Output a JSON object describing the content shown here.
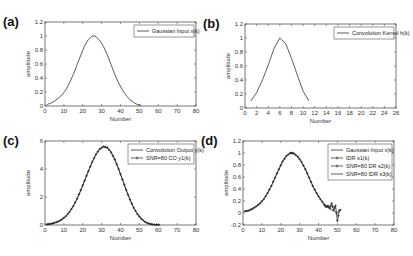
{
  "figure": {
    "line_color": "#333333",
    "axis_color": "#555555",
    "background": "#ffffff"
  },
  "chart_data": [
    {
      "id": "a",
      "panel_label": "(a)",
      "type": "line",
      "xlabel": "Number",
      "ylabel": "amplitude",
      "xlim": [
        0,
        80
      ],
      "ylim": [
        0,
        1.2
      ],
      "xticks": [
        0,
        10,
        20,
        30,
        40,
        50,
        60,
        70,
        80
      ],
      "yticks": [
        0,
        0.2,
        0.4,
        0.6,
        0.8,
        1,
        1.2
      ],
      "ytick_labels": [
        "0",
        "0.2",
        "0.4",
        "0.6",
        "0.8",
        "1",
        "1.2"
      ],
      "legend": [
        {
          "label": "Gaussian Input x(k)",
          "style": "line"
        }
      ],
      "legend_position": "upper right",
      "box": {
        "left": 45,
        "top": 22,
        "right": 196,
        "bottom": 106
      },
      "series": [
        {
          "name": "Gaussian Input x(k)",
          "style": "line",
          "x": [
            1,
            3,
            5,
            7,
            9,
            11,
            13,
            15,
            17,
            19,
            21,
            23,
            25,
            26,
            27,
            29,
            31,
            33,
            35,
            37,
            39,
            41,
            43,
            45,
            47,
            49,
            51
          ],
          "values": [
            0.02,
            0.04,
            0.07,
            0.11,
            0.16,
            0.23,
            0.33,
            0.45,
            0.59,
            0.73,
            0.86,
            0.95,
            1.0,
            1.0,
            0.99,
            0.94,
            0.85,
            0.73,
            0.59,
            0.45,
            0.33,
            0.23,
            0.15,
            0.09,
            0.05,
            0.02,
            0.01
          ]
        }
      ]
    },
    {
      "id": "b",
      "panel_label": "(b)",
      "type": "line",
      "xlabel": "Number",
      "ylabel": "amplitude",
      "xlim": [
        0,
        26
      ],
      "ylim": [
        0,
        1.2
      ],
      "xticks": [
        0,
        2,
        4,
        6,
        8,
        10,
        12,
        14,
        16,
        18,
        20,
        22,
        24,
        26
      ],
      "yticks": [
        0,
        0.2,
        0.4,
        0.6,
        0.8,
        1,
        1.2
      ],
      "ytick_labels": [
        "0",
        "0.2",
        "0.4",
        "0.6",
        "0.8",
        "1",
        "1.2"
      ],
      "legend": [
        {
          "label": "Convolution Kernel h(k)",
          "style": "line"
        }
      ],
      "legend_position": "upper right",
      "box": {
        "left": 245,
        "top": 24,
        "right": 396,
        "bottom": 108
      },
      "series": [
        {
          "name": "Convolution Kernel h(k)",
          "style": "line",
          "x": [
            1,
            2,
            3,
            4,
            5,
            6,
            7,
            8,
            9,
            10,
            11
          ],
          "values": [
            0.1,
            0.22,
            0.4,
            0.61,
            0.85,
            1.0,
            0.92,
            0.71,
            0.47,
            0.24,
            0.1
          ]
        }
      ]
    },
    {
      "id": "c",
      "panel_label": "(c)",
      "type": "line",
      "xlabel": "Number",
      "ylabel": "amplitude",
      "xlim": [
        0,
        80
      ],
      "ylim": [
        0,
        6
      ],
      "xticks": [
        0,
        10,
        20,
        30,
        40,
        50,
        60,
        70,
        80
      ],
      "yticks": [
        0,
        2,
        4,
        6
      ],
      "ytick_labels": [
        "0",
        "2",
        "4",
        "6"
      ],
      "legend": [
        {
          "label": "Convolution Output y(k)",
          "style": "line"
        },
        {
          "label": "SNR=80 CO y1(k)",
          "style": "line-marker"
        }
      ],
      "legend_position": "upper right",
      "box": {
        "left": 45,
        "top": 141,
        "right": 196,
        "bottom": 225
      },
      "series": [
        {
          "name": "Convolution Output y(k)",
          "style": "line",
          "x": [
            1,
            3,
            5,
            7,
            9,
            11,
            13,
            15,
            17,
            19,
            21,
            23,
            25,
            27,
            29,
            31,
            33,
            35,
            37,
            39,
            41,
            43,
            45,
            47,
            49,
            51,
            53,
            55,
            57,
            59,
            61
          ],
          "values": [
            0.05,
            0.08,
            0.15,
            0.25,
            0.4,
            0.62,
            0.93,
            1.35,
            1.88,
            2.5,
            3.17,
            3.85,
            4.5,
            5.05,
            5.42,
            5.6,
            5.52,
            5.2,
            4.68,
            4.0,
            3.25,
            2.5,
            1.82,
            1.23,
            0.77,
            0.44,
            0.22,
            0.1,
            0.04,
            0.02,
            0.01
          ]
        },
        {
          "name": "SNR=80 CO y1(k)",
          "style": "line-marker",
          "x": [
            1,
            3,
            5,
            7,
            9,
            11,
            13,
            15,
            17,
            19,
            21,
            23,
            25,
            27,
            29,
            31,
            33,
            35,
            37,
            39,
            41,
            43,
            45,
            47,
            49,
            51,
            53,
            55,
            57,
            59,
            61
          ],
          "values": [
            0.05,
            0.08,
            0.15,
            0.25,
            0.4,
            0.62,
            0.93,
            1.35,
            1.88,
            2.5,
            3.17,
            3.85,
            4.5,
            5.05,
            5.42,
            5.6,
            5.52,
            5.2,
            4.68,
            4.0,
            3.25,
            2.5,
            1.82,
            1.23,
            0.77,
            0.44,
            0.22,
            0.1,
            0.04,
            0.02,
            0.01
          ]
        }
      ]
    },
    {
      "id": "d",
      "panel_label": "(d)",
      "type": "line",
      "xlabel": "Number",
      "ylabel": "amplitude",
      "xlim": [
        0,
        80
      ],
      "ylim": [
        -0.2,
        1.2
      ],
      "xticks": [
        0,
        10,
        20,
        30,
        40,
        50,
        60,
        70,
        80
      ],
      "yticks": [
        -0.2,
        0,
        0.2,
        0.4,
        0.6,
        0.8,
        1,
        1.2
      ],
      "ytick_labels": [
        "-0.2",
        "0",
        "0.2",
        "0.4",
        "0.6",
        "0.8",
        "1",
        "1.2"
      ],
      "legend": [
        {
          "label": "Gaussian Input x(k)",
          "style": "line"
        },
        {
          "label": "IDR s1(k)",
          "style": "line-plus"
        },
        {
          "label": "SNR=80 DR s2(k)",
          "style": "line-marker"
        },
        {
          "label": "SNR=80 IDR s3(k)",
          "style": "line-thin"
        }
      ],
      "legend_position": "upper right",
      "box": {
        "left": 243,
        "top": 141,
        "right": 394,
        "bottom": 225
      },
      "series": [
        {
          "name": "Gaussian Input x(k)",
          "style": "line",
          "x": [
            1,
            3,
            5,
            7,
            9,
            11,
            13,
            15,
            17,
            19,
            21,
            23,
            25,
            26,
            27,
            29,
            31,
            33,
            35,
            37,
            39,
            41,
            43,
            45,
            47,
            49,
            51
          ],
          "values": [
            0.02,
            0.04,
            0.07,
            0.11,
            0.16,
            0.23,
            0.33,
            0.45,
            0.59,
            0.73,
            0.86,
            0.95,
            1.0,
            1.0,
            0.99,
            0.94,
            0.85,
            0.73,
            0.59,
            0.45,
            0.33,
            0.23,
            0.15,
            0.09,
            0.05,
            0.02,
            0.01
          ]
        },
        {
          "name": "SNR=80 DR s2(k)",
          "style": "line-marker",
          "x": [
            1,
            3,
            5,
            7,
            9,
            11,
            13,
            15,
            17,
            19,
            21,
            23,
            25,
            26,
            27,
            29,
            31,
            33,
            35,
            37,
            39,
            41,
            43,
            44,
            45,
            46,
            47,
            48,
            49,
            50,
            51,
            52
          ],
          "values": [
            0.03,
            0.04,
            0.07,
            0.11,
            0.16,
            0.23,
            0.33,
            0.45,
            0.59,
            0.73,
            0.86,
            0.95,
            1.0,
            1.0,
            0.99,
            0.94,
            0.85,
            0.73,
            0.59,
            0.45,
            0.33,
            0.23,
            0.14,
            0.1,
            0.12,
            0.08,
            0.16,
            0.05,
            0.12,
            -0.13,
            0.04,
            0.06
          ]
        }
      ]
    }
  ]
}
